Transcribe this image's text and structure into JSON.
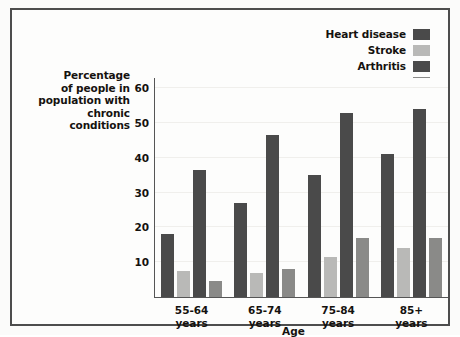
{
  "chart_data": {
    "type": "bar",
    "title": "",
    "categories": [
      "55-64\nyears",
      "65-74\nyears",
      "75-84\nyears",
      "85+\nyears"
    ],
    "category_lines": [
      [
        "55-64",
        "years"
      ],
      [
        "65-74",
        "years"
      ],
      [
        "75-84",
        "years"
      ],
      [
        "85+",
        "years"
      ]
    ],
    "series": [
      {
        "name": "Heart disease",
        "color": "#4a4a4a",
        "values": [
          18,
          27,
          35,
          41
        ]
      },
      {
        "name": "Stroke",
        "color": "#b9b9b7",
        "values": [
          7.5,
          7,
          11.5,
          14
        ]
      },
      {
        "name": "Arthritis",
        "color": "#4a4a4a",
        "values": [
          36.5,
          46.5,
          53,
          54
        ]
      },
      {
        "name": "Serious hearing problem",
        "color": "#8a8a88",
        "values": [
          4.5,
          8,
          17,
          17
        ]
      }
    ],
    "xlabel": "Age",
    "ylabel": "Percentage of people in population with chronic conditions",
    "ylabel_lines": [
      "Percentage",
      "of people in",
      "population with",
      "chronic conditions"
    ],
    "yticks": [
      10,
      20,
      30,
      40,
      50,
      60
    ],
    "ylim": [
      0,
      63
    ],
    "grid": true,
    "legend_position": "top-right"
  },
  "legend": {
    "items": [
      {
        "label": "Heart disease",
        "color": "#4a4a4a"
      },
      {
        "label": "Stroke",
        "color": "#b9b9b7"
      },
      {
        "label": "Arthritis",
        "color": "#4a4a4a"
      },
      {
        "label": "Serious hearing problem",
        "color": "#8a8a88"
      }
    ]
  }
}
